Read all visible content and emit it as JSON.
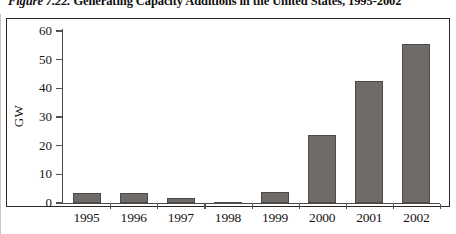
{
  "figure": {
    "number_label": "Figure 7.22.",
    "caption": "Generating Capacity Additions in the United States, 1995-2002"
  },
  "chart_data": {
    "type": "bar",
    "title": "Generating Capacity Additions in the United States, 1995-2002",
    "xlabel": "",
    "ylabel": "GW",
    "categories": [
      "1995",
      "1996",
      "1997",
      "1998",
      "1999",
      "2000",
      "2001",
      "2002"
    ],
    "values": [
      3.6,
      3.6,
      1.7,
      0.3,
      3.7,
      23.8,
      42.5,
      55.5
    ],
    "ylim": [
      0,
      60
    ],
    "yticks": [
      0,
      10,
      20,
      30,
      40,
      50,
      60
    ],
    "ytick_labels": [
      "0",
      "10",
      "20",
      "30",
      "40",
      "50",
      "60"
    ],
    "grid": false,
    "legend": false,
    "bar_color": "#6e6b69",
    "bar_edge_color": "#4d4a48",
    "axis_color": "#4a4745",
    "text_color": "#171413",
    "background": "#ffffff"
  }
}
